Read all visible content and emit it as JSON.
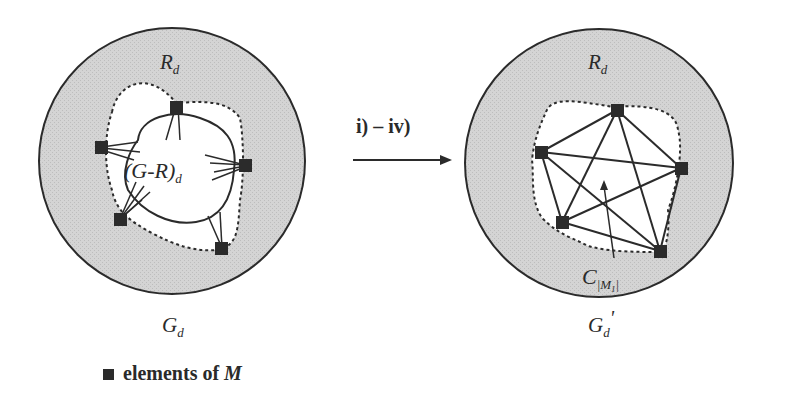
{
  "figure": {
    "left_graph": {
      "outer_label": "G",
      "outer_label_sub": "d",
      "region_label": "R",
      "region_label_sub": "d",
      "inner_label": "(G-R)",
      "inner_label_sub": "d"
    },
    "transition": {
      "label": "i) – iv)"
    },
    "right_graph": {
      "outer_label": "G",
      "outer_label_sub": "d",
      "outer_label_prime": "'",
      "region_label": "R",
      "region_label_sub": "d",
      "clique_label": "C",
      "clique_label_sub": "|M",
      "clique_label_subsub": "1",
      "clique_label_close": "|"
    },
    "legend": {
      "marker": "filled-square",
      "text_prefix": "elements of ",
      "text_symbol": "M"
    },
    "colors": {
      "region_fill": "#cfcfcf",
      "stroke": "#2b2b2b",
      "node": "#2b2b2b",
      "background": "#ffffff"
    }
  }
}
